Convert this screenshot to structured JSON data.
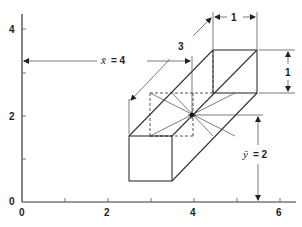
{
  "figure": {
    "type": "diagram",
    "axes": {
      "x_ticks": [
        "0",
        "2",
        "4",
        "6"
      ],
      "y_ticks": [
        "0",
        "2",
        "4"
      ],
      "origin_label": "0"
    },
    "dimensions": {
      "width_label": "1",
      "height_label": "1",
      "length_label": "3"
    },
    "centroid": {
      "x_label": "x̄ = 4",
      "y_label": "ȳ = 2",
      "x_bar_symbol": "x̄",
      "x_bar_value": "= 4",
      "y_bar_symbol": "ȳ",
      "y_bar_value": "= 2",
      "marker": "star"
    },
    "colors": {
      "line": "#333333",
      "background": "#ffffff"
    }
  }
}
